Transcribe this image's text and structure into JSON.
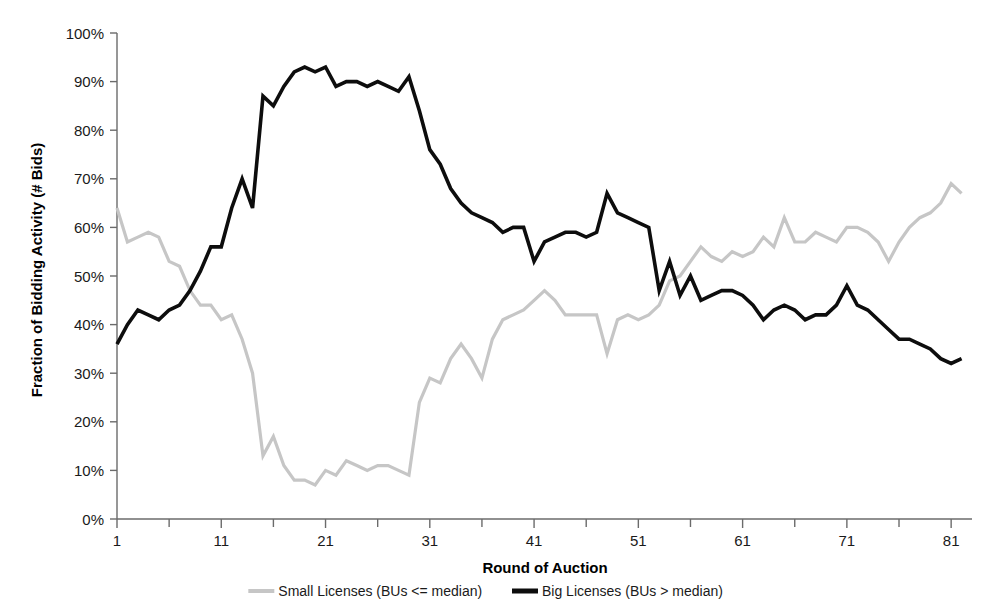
{
  "chart_data": {
    "type": "line",
    "title": "",
    "xlabel": "Round of Auction",
    "ylabel": "Fraction of Bidding Activity (# Bids)",
    "xlim": [
      1,
      83
    ],
    "ylim": [
      0,
      1.0
    ],
    "grid": false,
    "legend_position": "bottom",
    "x_tick_labels": [
      "1",
      "11",
      "21",
      "31",
      "41",
      "51",
      "61",
      "71",
      "81"
    ],
    "x_tick_values": [
      1,
      11,
      21,
      31,
      41,
      51,
      61,
      71,
      81
    ],
    "x_minor_tick_values": [
      6,
      16,
      26,
      36,
      46,
      56,
      66,
      76
    ],
    "y_tick_labels": [
      "0%",
      "10%",
      "20%",
      "30%",
      "40%",
      "50%",
      "60%",
      "70%",
      "80%",
      "90%",
      "100%"
    ],
    "y_tick_values": [
      0,
      10,
      20,
      30,
      40,
      50,
      60,
      70,
      80,
      90,
      100
    ],
    "x": [
      1,
      2,
      3,
      4,
      5,
      6,
      7,
      8,
      9,
      10,
      11,
      12,
      13,
      14,
      15,
      16,
      17,
      18,
      19,
      20,
      21,
      22,
      23,
      24,
      25,
      26,
      27,
      28,
      29,
      30,
      31,
      32,
      33,
      34,
      35,
      36,
      37,
      38,
      39,
      40,
      41,
      42,
      43,
      44,
      45,
      46,
      47,
      48,
      49,
      50,
      51,
      52,
      53,
      54,
      55,
      56,
      57,
      58,
      59,
      60,
      61,
      62,
      63,
      64,
      65,
      66,
      67,
      68,
      69,
      70,
      71,
      72,
      73,
      74,
      75,
      76,
      77,
      78,
      79,
      80,
      81,
      82
    ],
    "series": [
      {
        "name": "Small Licenses (BUs <= median)",
        "color": "#c6c6c6",
        "stroke_width": 3.2,
        "values": [
          64,
          57,
          58,
          59,
          58,
          53,
          52,
          47,
          44,
          44,
          41,
          42,
          37,
          30,
          13,
          17,
          11,
          8,
          8,
          7,
          10,
          9,
          12,
          11,
          10,
          11,
          11,
          10,
          9,
          24,
          29,
          28,
          33,
          36,
          33,
          29,
          37,
          41,
          42,
          43,
          45,
          47,
          45,
          42,
          42,
          42,
          42,
          34,
          41,
          42,
          41,
          42,
          44,
          49,
          50,
          53,
          56,
          54,
          53,
          55,
          54,
          55,
          58,
          56,
          62,
          57,
          57,
          59,
          58,
          57,
          60,
          60,
          59,
          57,
          53,
          57,
          60,
          62,
          63,
          65,
          69,
          67
        ]
      },
      {
        "name": "Big Licenses (BUs > median)",
        "color": "#0d0d0d",
        "stroke_width": 3.6,
        "values": [
          36,
          40,
          43,
          42,
          41,
          43,
          44,
          47,
          51,
          56,
          56,
          64,
          70,
          64,
          87,
          85,
          89,
          92,
          93,
          92,
          93,
          89,
          90,
          90,
          89,
          90,
          89,
          88,
          91,
          84,
          76,
          73,
          68,
          65,
          63,
          62,
          61,
          59,
          60,
          60,
          53,
          57,
          58,
          59,
          59,
          58,
          59,
          67,
          63,
          62,
          61,
          60,
          47,
          53,
          46,
          50,
          45,
          46,
          47,
          47,
          46,
          44,
          41,
          43,
          44,
          43,
          41,
          42,
          42,
          44,
          48,
          44,
          43,
          41,
          39,
          37,
          37,
          36,
          35,
          33,
          32,
          33
        ]
      }
    ]
  },
  "legend": {
    "items": [
      {
        "label": "Small Licenses (BUs <= median)",
        "color": "#c6c6c6"
      },
      {
        "label": "Big Licenses (BUs > median)",
        "color": "#0d0d0d"
      }
    ]
  }
}
